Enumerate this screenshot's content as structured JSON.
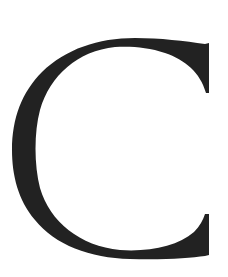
{
  "image": {
    "subject": "Serif capital letter",
    "letter": "C",
    "letter_color": "#222222",
    "background_color": "#ffffff"
  }
}
